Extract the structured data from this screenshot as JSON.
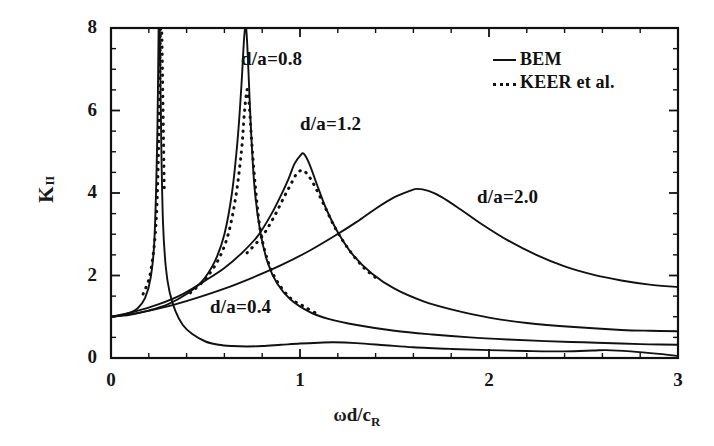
{
  "figure": {
    "background": "#ffffff",
    "line_color": "#111111"
  },
  "axes": {
    "x_ticks": [
      "0",
      "1",
      "2",
      "3"
    ],
    "y_ticks": [
      "0",
      "2",
      "4",
      "6",
      "8"
    ],
    "xlabel_parts": {
      "omega": "ω",
      "middle": "d/c",
      "sub": "R"
    },
    "ylabel_parts": {
      "main": "K",
      "sub": "II"
    }
  },
  "legend": {
    "entries": [
      {
        "label": "BEM",
        "style": "solid",
        "icon": "solid-line-icon"
      },
      {
        "label": "KEER et al.",
        "style": "dotted",
        "icon": "dotted-line-icon"
      }
    ]
  },
  "annotations": [
    {
      "id": "ann-04",
      "text": "d/a=0.4",
      "x": 210,
      "y": 296
    },
    {
      "id": "ann-08",
      "text": "d/a=0.8",
      "x": 241,
      "y": 48
    },
    {
      "id": "ann-12",
      "text": "d/a=1.2",
      "x": 300,
      "y": 113
    },
    {
      "id": "ann-20",
      "text": "d/a=2.0",
      "x": 477,
      "y": 186
    }
  ],
  "chart_data": {
    "type": "line",
    "title": "",
    "xlabel": "ωd/c_R",
    "ylabel": "K_II",
    "xlim": [
      0,
      3
    ],
    "ylim": [
      0,
      8
    ],
    "grid": false,
    "legend_position": "top-right",
    "x_major_ticks": [
      0,
      1,
      2,
      3
    ],
    "y_major_ticks": [
      0,
      2,
      4,
      6,
      8
    ],
    "x_minor_tick_step": 0.2,
    "y_minor_tick_step": 0.5,
    "series": [
      {
        "name": "d/a=0.4 (BEM)",
        "style": "solid",
        "label": "d/a=0.4",
        "peak_x": 0.255,
        "peak_y": 14.0,
        "clipped_at_top": true,
        "x": [
          0.0,
          0.05,
          0.1,
          0.14,
          0.18,
          0.21,
          0.23,
          0.245,
          0.252,
          0.258,
          0.266,
          0.275,
          0.29,
          0.31,
          0.34,
          0.38,
          0.43,
          0.5,
          0.57,
          0.64,
          0.72,
          0.8,
          0.9,
          1.0,
          1.1,
          1.18,
          1.3,
          1.45,
          1.6,
          1.8,
          2.0,
          2.2,
          2.4,
          2.55,
          2.62,
          2.75,
          2.9,
          3.0
        ],
        "y": [
          1.0,
          1.03,
          1.1,
          1.2,
          1.45,
          1.95,
          2.9,
          5.4,
          8.0,
          8.0,
          5.2,
          3.3,
          2.2,
          1.6,
          1.15,
          0.8,
          0.58,
          0.4,
          0.32,
          0.29,
          0.28,
          0.29,
          0.32,
          0.35,
          0.37,
          0.38,
          0.36,
          0.31,
          0.26,
          0.22,
          0.19,
          0.17,
          0.16,
          0.18,
          0.19,
          0.16,
          0.1,
          0.05
        ]
      },
      {
        "name": "d/a=0.4 (KEER et al.)",
        "style": "dotted",
        "label": "d/a=0.4",
        "peak_x": 0.268,
        "peak_y": 14.0,
        "clipped_at_top": true,
        "x": [
          0.17,
          0.21,
          0.24,
          0.255,
          0.262,
          0.268,
          0.275,
          0.282
        ],
        "y": [
          1.55,
          2.1,
          3.4,
          5.8,
          8.0,
          8.0,
          6.1,
          4.0
        ]
      },
      {
        "name": "d/a=0.8 (BEM)",
        "style": "solid",
        "label": "d/a=0.8",
        "peak_x": 0.715,
        "peak_y": 11.5,
        "clipped_at_top": true,
        "x": [
          0.0,
          0.1,
          0.2,
          0.3,
          0.4,
          0.48,
          0.55,
          0.6,
          0.64,
          0.67,
          0.69,
          0.705,
          0.715,
          0.725,
          0.74,
          0.76,
          0.79,
          0.83,
          0.88,
          0.95,
          1.05,
          1.15,
          1.3,
          1.5,
          1.7,
          1.9,
          2.1,
          2.3,
          2.5,
          2.7,
          2.85,
          3.0
        ],
        "y": [
          1.0,
          1.05,
          1.15,
          1.3,
          1.55,
          1.85,
          2.35,
          3.0,
          4.0,
          5.3,
          6.6,
          7.8,
          8.0,
          7.2,
          5.6,
          4.1,
          3.05,
          2.3,
          1.8,
          1.42,
          1.12,
          0.95,
          0.8,
          0.66,
          0.57,
          0.5,
          0.45,
          0.41,
          0.38,
          0.35,
          0.33,
          0.32
        ]
      },
      {
        "name": "d/a=0.8 (KEER et al.)",
        "style": "dotted",
        "label": "d/a=0.8",
        "peak_x": 0.722,
        "peak_y": 6.5,
        "clipped_at_top": false,
        "x": [
          0.42,
          0.5,
          0.57,
          0.62,
          0.66,
          0.69,
          0.705,
          0.715,
          0.722,
          0.732,
          0.745,
          0.765,
          0.79,
          0.83,
          0.88,
          0.95,
          1.02,
          1.1
        ],
        "y": [
          1.58,
          1.92,
          2.4,
          3.0,
          3.9,
          5.0,
          5.9,
          6.35,
          6.5,
          6.1,
          5.2,
          4.1,
          3.1,
          2.35,
          1.85,
          1.45,
          1.25,
          1.05
        ]
      },
      {
        "name": "d/a=1.2 (BEM)",
        "style": "solid",
        "label": "d/a=1.2",
        "peak_x": 1.02,
        "peak_y": 4.95,
        "clipped_at_top": false,
        "x": [
          0.0,
          0.12,
          0.25,
          0.38,
          0.5,
          0.6,
          0.7,
          0.78,
          0.85,
          0.9,
          0.94,
          0.97,
          1.0,
          1.02,
          1.05,
          1.09,
          1.14,
          1.2,
          1.28,
          1.38,
          1.5,
          1.65,
          1.8,
          2.0,
          2.2,
          2.45,
          2.7,
          2.85,
          3.0
        ],
        "y": [
          1.0,
          1.12,
          1.3,
          1.55,
          1.88,
          2.18,
          2.58,
          2.98,
          3.5,
          3.95,
          4.35,
          4.7,
          4.9,
          4.95,
          4.7,
          4.2,
          3.6,
          3.05,
          2.5,
          2.05,
          1.68,
          1.38,
          1.18,
          0.98,
          0.85,
          0.75,
          0.68,
          0.66,
          0.65
        ]
      },
      {
        "name": "d/a=1.2 (KEER et al.)",
        "style": "dotted",
        "label": "d/a=1.2",
        "peak_x": 1.01,
        "peak_y": 4.55,
        "clipped_at_top": false,
        "x": [
          0.72,
          0.8,
          0.86,
          0.91,
          0.95,
          0.98,
          1.01,
          1.04,
          1.08,
          1.13,
          1.19,
          1.26,
          1.34,
          1.42
        ],
        "y": [
          2.55,
          2.95,
          3.4,
          3.85,
          4.2,
          4.45,
          4.55,
          4.45,
          4.15,
          3.68,
          3.12,
          2.62,
          2.18,
          1.88
        ]
      },
      {
        "name": "d/a=2.0 (BEM)",
        "style": "solid",
        "label": "d/a=2.0",
        "peak_x": 1.62,
        "peak_y": 4.1,
        "clipped_at_top": false,
        "x": [
          0.0,
          0.15,
          0.3,
          0.45,
          0.6,
          0.75,
          0.9,
          1.05,
          1.18,
          1.3,
          1.4,
          1.5,
          1.58,
          1.62,
          1.68,
          1.75,
          1.85,
          1.95,
          2.1,
          2.25,
          2.4,
          2.55,
          2.7,
          2.85,
          3.0
        ],
        "y": [
          1.0,
          1.1,
          1.25,
          1.45,
          1.68,
          1.95,
          2.25,
          2.6,
          2.95,
          3.3,
          3.62,
          3.9,
          4.05,
          4.1,
          4.05,
          3.9,
          3.6,
          3.28,
          2.85,
          2.5,
          2.22,
          2.02,
          1.88,
          1.78,
          1.72
        ]
      }
    ]
  }
}
